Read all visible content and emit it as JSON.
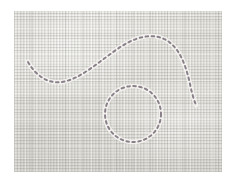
{
  "image": {
    "subject": "linen-fabric-swatch-with-dashed-tailor-markings",
    "width": 234,
    "height": 180,
    "page_background": "#ffffff"
  },
  "fabric": {
    "name": "woven-linen-swatch",
    "material": "linen",
    "weave": "plain-crosshatch",
    "base_color": "#e3e2dd",
    "highlight_color": "#f1f0ec",
    "shadow_color": "#c8c6c0",
    "bounds": {
      "x": 14,
      "y": 11,
      "width": 208,
      "height": 161
    }
  },
  "markings": {
    "name": "dashed-tracing-lines",
    "ink_color": "#8a8089",
    "ink_color_soft": "#a59ea4",
    "halo_color": "#f3f2ef",
    "dash_length": 2.6,
    "dash_gap": 3.4,
    "stroke_width": 2.0,
    "paths": [
      {
        "name": "s-curve-line",
        "type": "open-curve",
        "d": "M 28 62 C 36 76 48 84 62 82 C 80 79 96 64 116 50 C 134 37 152 32 166 40 C 180 48 186 66 190 84 C 192 94 194 100 196 105",
        "start_point": [
          28,
          62
        ],
        "peak_point": [
          163,
          37
        ],
        "end_point": [
          196,
          105
        ]
      },
      {
        "name": "circle-line",
        "type": "closed-circle",
        "center": [
          133,
          114
        ],
        "radius": 28
      }
    ]
  }
}
